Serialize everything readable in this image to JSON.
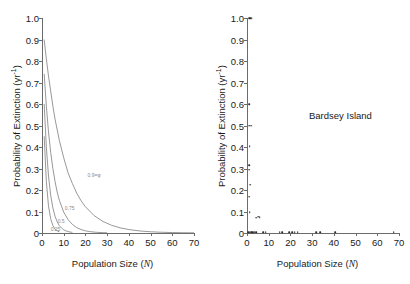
{
  "figure": {
    "background": "#ffffff",
    "axis_color": "#6b6b6b",
    "curve_color": "#7d7d7d",
    "point_color": "#2b2b2b"
  },
  "axes": {
    "ylabel_text": "Probability of Extinction (yr",
    "ylabel_sup": "-1",
    "ylabel_close": ")",
    "xlabel_pre": "Population Size (",
    "xlabel_var": "N",
    "xlabel_post": ")",
    "yticks": [
      "1.0",
      "0.9",
      "0.8",
      "0.7",
      "0.6",
      "0.5",
      "0.4",
      "0.3",
      "0.2",
      "0.1",
      "0"
    ],
    "ytick_values": [
      1.0,
      0.9,
      0.8,
      0.7,
      0.6,
      0.5,
      0.4,
      0.3,
      0.2,
      0.1,
      0
    ],
    "xticks": [
      "0",
      "10",
      "20",
      "30",
      "40",
      "50",
      "60",
      "70"
    ],
    "xtick_values": [
      0,
      10,
      20,
      30,
      40,
      50,
      60,
      70
    ],
    "ylim": [
      0,
      1.0
    ],
    "xlim": [
      0,
      70
    ]
  },
  "chart_data": [
    {
      "type": "line",
      "panel": "left",
      "title": "",
      "xlabel": "Population Size (N)",
      "ylabel": "Probability of Extinction (yr-1)",
      "xlim": [
        0,
        70
      ],
      "ylim": [
        0,
        1.0
      ],
      "grid": false,
      "legend_position": "inline-annotations",
      "series": [
        {
          "name": "0.9",
          "label": "0.9=φ",
          "label_x": 21,
          "label_y": 0.27,
          "x": [
            1,
            2,
            3,
            4,
            5,
            6,
            8,
            10,
            12,
            14,
            16,
            18,
            20,
            24,
            28,
            32,
            36,
            40,
            45,
            50,
            55,
            60,
            65,
            70
          ],
          "y": [
            0.9,
            0.81,
            0.73,
            0.66,
            0.59,
            0.53,
            0.43,
            0.35,
            0.28,
            0.23,
            0.185,
            0.15,
            0.122,
            0.081,
            0.054,
            0.036,
            0.024,
            0.016,
            0.0095,
            0.0058,
            0.0035,
            0.0021,
            0.0013,
            0.0008
          ]
        },
        {
          "name": "0.75",
          "label": "0.75",
          "label_x": 10.5,
          "label_y": 0.115,
          "x": [
            1,
            2,
            3,
            4,
            5,
            6,
            7,
            8,
            10,
            12,
            14,
            16,
            18,
            20,
            22,
            25,
            28,
            30
          ],
          "y": [
            0.74,
            0.59,
            0.47,
            0.375,
            0.3,
            0.24,
            0.19,
            0.152,
            0.097,
            0.062,
            0.04,
            0.025,
            0.016,
            0.01,
            0.0065,
            0.0033,
            0.0017,
            0.0011
          ]
        },
        {
          "name": "0.5",
          "label": "0.5",
          "label_x": 7.2,
          "label_y": 0.055,
          "x": [
            1,
            2,
            3,
            4,
            5,
            6,
            7,
            8,
            9,
            10,
            11,
            12,
            13,
            14
          ],
          "y": [
            0.6,
            0.4,
            0.265,
            0.175,
            0.117,
            0.078,
            0.052,
            0.034,
            0.023,
            0.015,
            0.01,
            0.0067,
            0.0044,
            0.003
          ]
        },
        {
          "name": "0.25",
          "label": "0.25",
          "label_x": 4.0,
          "label_y": 0.018,
          "x": [
            1,
            2,
            3,
            4,
            5,
            6,
            7,
            8
          ],
          "y": [
            0.45,
            0.24,
            0.125,
            0.066,
            0.035,
            0.018,
            0.01,
            0.005
          ]
        }
      ]
    },
    {
      "type": "scatter",
      "panel": "right",
      "title": "Bardsey Island",
      "xlabel": "Population Size (N)",
      "ylabel": "Probability of Extinction (yr-1)",
      "xlim": [
        0,
        70
      ],
      "ylim": [
        0,
        1.0
      ],
      "grid": false,
      "points": [
        {
          "x": 1,
          "y": 1.0
        },
        {
          "x": 1.6,
          "y": 1.0
        },
        {
          "x": 2.2,
          "y": 1.0
        },
        {
          "x": 1,
          "y": 0.6
        },
        {
          "x": 1,
          "y": 0.5
        },
        {
          "x": 1.8,
          "y": 0.5
        },
        {
          "x": 1.2,
          "y": 0.405
        },
        {
          "x": 1,
          "y": 0.315
        },
        {
          "x": 1.1,
          "y": 0.295
        },
        {
          "x": 1.6,
          "y": 0.225
        },
        {
          "x": 1,
          "y": 0.168
        },
        {
          "x": 1.2,
          "y": 0.098
        },
        {
          "x": 4.2,
          "y": 0.072
        },
        {
          "x": 5.2,
          "y": 0.075
        },
        {
          "x": 5.8,
          "y": 0.074
        },
        {
          "x": 0.6,
          "y": 0.004
        },
        {
          "x": 1.2,
          "y": 0.004
        },
        {
          "x": 1.8,
          "y": 0.004
        },
        {
          "x": 2.4,
          "y": 0.004
        },
        {
          "x": 3.0,
          "y": 0.004
        },
        {
          "x": 3.6,
          "y": 0.004
        },
        {
          "x": 4.2,
          "y": 0.004
        },
        {
          "x": 7.5,
          "y": 0.004
        },
        {
          "x": 8.6,
          "y": 0.004
        },
        {
          "x": 15.0,
          "y": 0.004
        },
        {
          "x": 16.2,
          "y": 0.004
        },
        {
          "x": 19.5,
          "y": 0.004
        },
        {
          "x": 20.8,
          "y": 0.004
        },
        {
          "x": 22.0,
          "y": 0.004
        },
        {
          "x": 23.4,
          "y": 0.004
        },
        {
          "x": 32.0,
          "y": 0.004
        },
        {
          "x": 33.6,
          "y": 0.004
        },
        {
          "x": 40.5,
          "y": 0.004
        },
        {
          "x": 67.5,
          "y": 0.004
        }
      ]
    }
  ],
  "right_panel": {
    "annotation": "Bardsey Island"
  }
}
